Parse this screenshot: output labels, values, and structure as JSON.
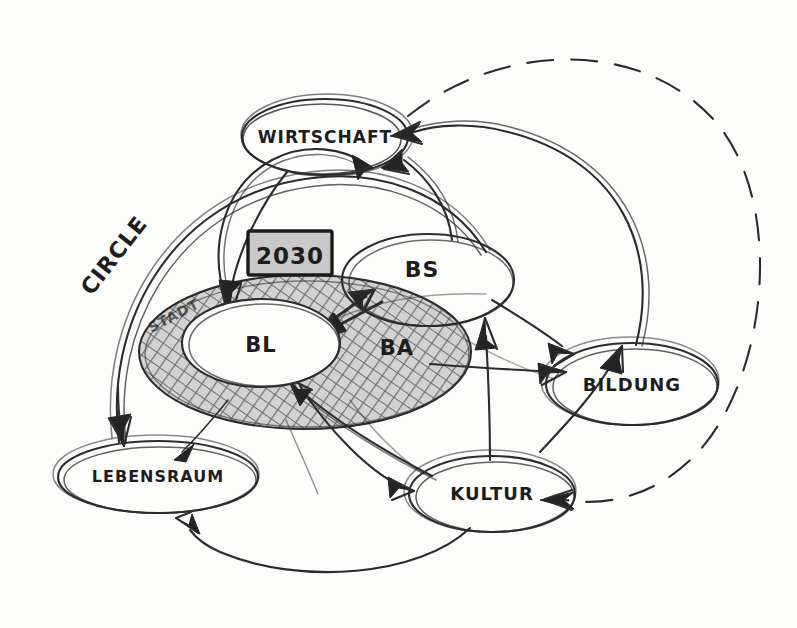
{
  "diagram": {
    "title_label": "CIRCLE",
    "style": "hand-drawn pencil sketch on white paper",
    "colors": {
      "ink": "#2c2c2c",
      "hatch": "#9b9b9b",
      "box_fill": "#c9c9c9",
      "paper": "#fdfdfc"
    }
  },
  "nodes": [
    {
      "id": "wirtschaft",
      "label": "WIRTSCHAFT",
      "cx": 325,
      "cy": 137,
      "rx": 83,
      "ry": 38,
      "shape": "ellipse"
    },
    {
      "id": "bs",
      "label": "BS",
      "cx": 428,
      "cy": 280,
      "rx": 86,
      "ry": 46,
      "shape": "ellipse"
    },
    {
      "id": "bl",
      "label": "BL",
      "cx": 261,
      "cy": 343,
      "rx": 79,
      "ry": 44,
      "shape": "ellipse"
    },
    {
      "id": "ba",
      "label": "BA",
      "cx": 397,
      "cy": 348,
      "rx": 0,
      "ry": 0,
      "shape": "label-only"
    },
    {
      "id": "stadt",
      "label": "STADT",
      "cx": 176,
      "cy": 318,
      "rx": 0,
      "ry": 0,
      "shape": "label-only"
    },
    {
      "id": "bildung",
      "label": "BILDUNG",
      "cx": 632,
      "cy": 384,
      "rx": 86,
      "ry": 41,
      "shape": "ellipse"
    },
    {
      "id": "lebensraum",
      "label": "LEBENSRAUM",
      "cx": 158,
      "cy": 477,
      "rx": 100,
      "ry": 36,
      "shape": "ellipse"
    },
    {
      "id": "kultur",
      "label": "KULTUR",
      "cx": 492,
      "cy": 494,
      "rx": 83,
      "ry": 38,
      "shape": "ellipse"
    }
  ],
  "annotations": [
    {
      "id": "year-box",
      "label": "2030",
      "x": 248,
      "y": 231,
      "width": 84,
      "height": 44,
      "fill": "#c9c9c9"
    }
  ],
  "regions": [
    {
      "id": "hatched-ring",
      "label": "hatched emphasis ellipse around BL and BA",
      "cx": 305,
      "cy": 352,
      "rx": 165,
      "ry": 76,
      "fill": "hatch"
    }
  ],
  "edges": [
    {
      "id": "bl-to-wirtschaft",
      "from": "bl",
      "to": "wirtschaft",
      "style": "solid",
      "arrow": "single"
    },
    {
      "id": "bs-to-wirtschaft",
      "from": "bs",
      "to": "wirtschaft",
      "style": "solid",
      "arrow": "single"
    },
    {
      "id": "bildung-to-wirtschaft",
      "from": "bildung",
      "to": "wirtschaft",
      "style": "solid",
      "arrow": "single"
    },
    {
      "id": "wirtschaft-to-bl",
      "from": "wirtschaft",
      "to": "bl",
      "style": "solid",
      "arrow": "single"
    },
    {
      "id": "bl-to-bs",
      "from": "bl",
      "to": "bs",
      "style": "solid",
      "arrow": "single"
    },
    {
      "id": "bs-to-bl",
      "from": "bs",
      "to": "bl",
      "style": "solid",
      "arrow": "single"
    },
    {
      "id": "bs-to-bildung",
      "from": "bs",
      "to": "bildung",
      "style": "solid",
      "arrow": "single"
    },
    {
      "id": "kultur-to-bs",
      "from": "kultur",
      "to": "bs",
      "style": "solid",
      "arrow": "single"
    },
    {
      "id": "bl-to-kultur",
      "from": "bl",
      "to": "kultur",
      "style": "solid",
      "arrow": "single"
    },
    {
      "id": "kultur-to-bl",
      "from": "kultur",
      "to": "bl",
      "style": "solid",
      "arrow": "single"
    },
    {
      "id": "circle-to-lebensraum",
      "from": "wirtschaft",
      "to": "lebensraum",
      "style": "solid",
      "arrow": "single"
    },
    {
      "id": "bl-to-lebensraum",
      "from": "bl",
      "to": "lebensraum",
      "style": "solid",
      "arrow": "single"
    },
    {
      "id": "kultur-to-lebensraum",
      "from": "kultur",
      "to": "lebensraum",
      "style": "solid",
      "arrow": "single"
    },
    {
      "id": "ba-to-bildung",
      "from": "ba",
      "to": "bildung",
      "style": "solid",
      "arrow": "single"
    },
    {
      "id": "wirtschaft-to-kultur-dashed",
      "from": "wirtschaft",
      "to": "kultur",
      "style": "dashed",
      "arrow": "single"
    }
  ]
}
